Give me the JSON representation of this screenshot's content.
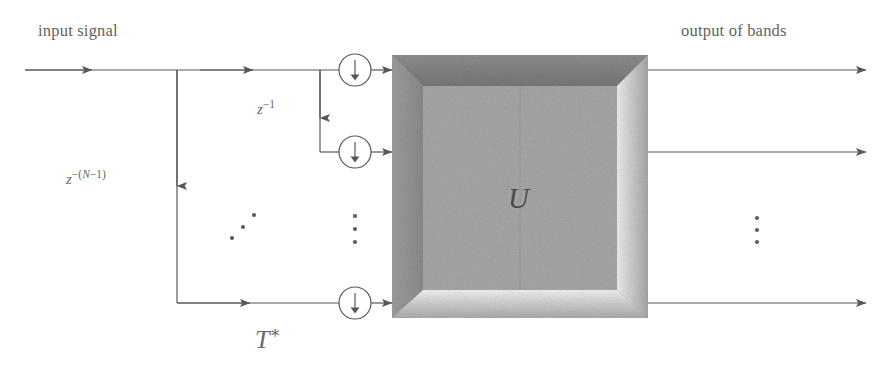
{
  "diagram": {
    "labels": {
      "input_signal": "input signal",
      "output_of_bands": "output of bands",
      "delay_one": "z",
      "delay_one_exponent": "−1",
      "delay_n_base": "z",
      "delay_n_exponent_open": "−(",
      "delay_n_exponent_var": "N",
      "delay_n_exponent_close": "−1)",
      "transform_operator": "T",
      "transform_operator_sup": "∗",
      "block_symbol": "U"
    },
    "block": {
      "name": "U",
      "style": "beveled-inset-gray",
      "x": 392,
      "y": 55,
      "width": 256,
      "height": 263,
      "fill": "#9e9e9e",
      "bevel_light": "#f2f2f2",
      "bevel_dark": "#6f6f6f",
      "inner_fill": "#a8a8a8"
    },
    "downsamplers": [
      {
        "name": "downsampler-1",
        "cx": 355,
        "cy": 70,
        "r": 16,
        "glyph": "↓"
      },
      {
        "name": "downsampler-2",
        "cx": 355,
        "cy": 152,
        "r": 16,
        "glyph": "↓"
      },
      {
        "name": "downsampler-3",
        "cx": 355,
        "cy": 303,
        "r": 16,
        "glyph": "↓"
      }
    ],
    "signal_lines": {
      "input_main_y": 70,
      "input_start_x": 25,
      "branch_x": 177,
      "delay_branch_x": 320,
      "second_row_y": 152,
      "bottom_row_y": 303,
      "output_start_x": 648,
      "output_end_x": 866
    },
    "ellipses": [
      {
        "name": "diagonal-ellipsis-left",
        "kind": "diagonal",
        "points": [
          [
            232,
            238
          ],
          [
            243,
            227
          ],
          [
            254,
            215
          ]
        ]
      },
      {
        "name": "vertical-ellipsis-middle",
        "kind": "vertical",
        "points": [
          [
            355,
            216
          ],
          [
            355,
            229
          ],
          [
            355,
            242
          ]
        ]
      },
      {
        "name": "vertical-ellipsis-right",
        "kind": "vertical",
        "points": [
          [
            757,
            218
          ],
          [
            757,
            230
          ],
          [
            757,
            242
          ]
        ]
      }
    ],
    "colors": {
      "line": "#585858",
      "text": "#5f5f5f",
      "background": "#ffffff",
      "block_gray": "#9e9e9e"
    }
  }
}
